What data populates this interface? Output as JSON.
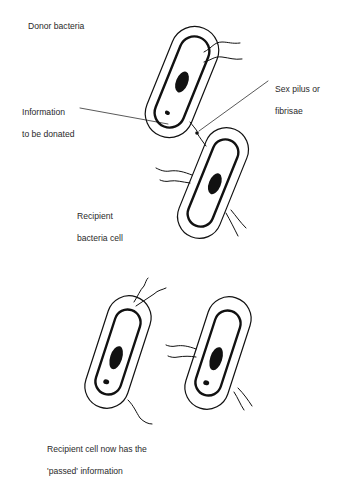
{
  "labels": {
    "donor": "Donor bacteria",
    "info_line1": "Information",
    "info_line2": "to be donated",
    "pilus_line1": "Sex pilus or",
    "pilus_line2": "fibrisae",
    "recipient_line1": "Recipient",
    "recipient_line2": "bacteria cell",
    "result_line1": "Recipient cell now has the",
    "result_line2": "'passed' information"
  },
  "colors": {
    "ink": "#111111",
    "text": "#2a2a2a",
    "background": "#ffffff"
  }
}
